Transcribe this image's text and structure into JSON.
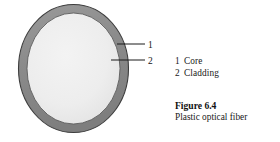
{
  "figure": {
    "caption_title": "Figure 6.4",
    "caption_subtitle": "Plastic optical fiber",
    "background_color": "#ffffff"
  },
  "diagram": {
    "name": "optical-fiber-cross-section",
    "cladding": {
      "marker": "2",
      "label": "Cladding",
      "fill_color": "#8b8b8b",
      "stroke_color": "#3a3a3a"
    },
    "core": {
      "marker": "1",
      "label": "Core",
      "fill_color": "#ededed",
      "stroke_color": "#555555"
    },
    "leader_lines": {
      "stroke_color": "#1a1a1a",
      "callout_1_number": "1",
      "callout_2_number": "2"
    }
  },
  "legend": {
    "items": [
      {
        "number": "1",
        "label": "Core"
      },
      {
        "number": "2",
        "label": "Cladding"
      }
    ]
  }
}
